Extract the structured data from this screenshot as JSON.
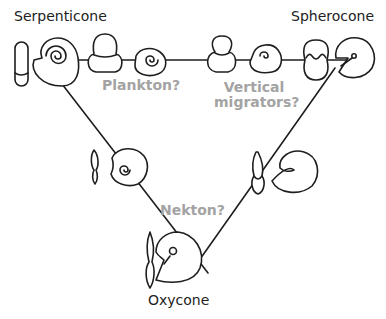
{
  "diagram": {
    "morphotypes": [
      {
        "id": "serpenticone",
        "label": "Serpenticone"
      },
      {
        "id": "spherocone",
        "label": "Spherocone"
      },
      {
        "id": "oxycone",
        "label": "Oxycone"
      }
    ],
    "habitats": [
      {
        "id": "plankton",
        "label": "Plankton?"
      },
      {
        "id": "vertical-migrators",
        "line1": "Vertical",
        "line2": "migrators?"
      },
      {
        "id": "nekton",
        "label": "Nekton?"
      }
    ],
    "colors": {
      "line": "#1e1e1e",
      "morph_label": "#222222",
      "habitat_label": "#a3a3a3",
      "background": "#ffffff"
    }
  }
}
